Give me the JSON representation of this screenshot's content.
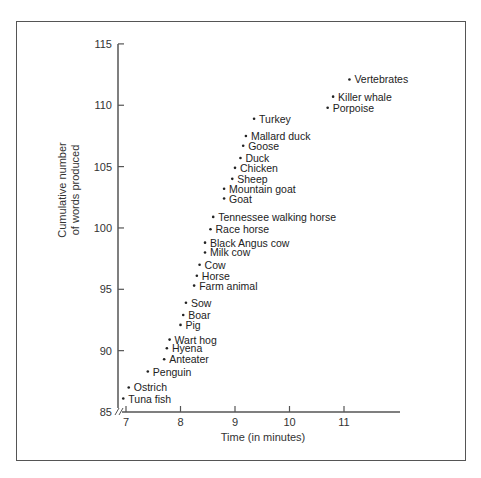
{
  "chart_data": {
    "type": "scatter",
    "title": "",
    "xlabel": "Time (in minutes)",
    "ylabel": "Cumulative number of words produced",
    "ylabel_lines": [
      "Cumulative number",
      "of words produced"
    ],
    "xlim": [
      7,
      12
    ],
    "ylim": [
      85,
      115
    ],
    "x_ticks": [
      7,
      8,
      9,
      10,
      11
    ],
    "y_ticks": [
      85,
      90,
      95,
      100,
      105,
      110,
      115
    ],
    "grid": false,
    "legend": "none",
    "axis_break": "y-axis broken near origin (85)",
    "points": [
      {
        "label": "Vertebrates",
        "x": 11.1,
        "y": 112.1
      },
      {
        "label": "Killer whale",
        "x": 10.8,
        "y": 110.7
      },
      {
        "label": "Porpoise",
        "x": 10.7,
        "y": 109.8
      },
      {
        "label": "Turkey",
        "x": 9.35,
        "y": 108.9
      },
      {
        "label": "Mallard duck",
        "x": 9.2,
        "y": 107.5
      },
      {
        "label": "Goose",
        "x": 9.15,
        "y": 106.7
      },
      {
        "label": "Duck",
        "x": 9.1,
        "y": 105.7
      },
      {
        "label": "Chicken",
        "x": 9.0,
        "y": 104.9
      },
      {
        "label": "Sheep",
        "x": 8.95,
        "y": 104.0
      },
      {
        "label": "Mountain goat",
        "x": 8.8,
        "y": 103.2
      },
      {
        "label": "Goat",
        "x": 8.8,
        "y": 102.4
      },
      {
        "label": "Tennessee walking horse",
        "x": 8.6,
        "y": 100.9
      },
      {
        "label": "Race horse",
        "x": 8.55,
        "y": 99.9
      },
      {
        "label": "Black Angus cow",
        "x": 8.45,
        "y": 98.8
      },
      {
        "label": "Milk cow",
        "x": 8.45,
        "y": 98.0
      },
      {
        "label": "Cow",
        "x": 8.35,
        "y": 97.0
      },
      {
        "label": "Horse",
        "x": 8.3,
        "y": 96.1
      },
      {
        "label": "Farm animal",
        "x": 8.25,
        "y": 95.3
      },
      {
        "label": "Sow",
        "x": 8.1,
        "y": 93.9
      },
      {
        "label": "Boar",
        "x": 8.05,
        "y": 92.9
      },
      {
        "label": "Pig",
        "x": 8.0,
        "y": 92.1
      },
      {
        "label": "Wart hog",
        "x": 7.8,
        "y": 90.9
      },
      {
        "label": "Hyena",
        "x": 7.75,
        "y": 90.2
      },
      {
        "label": "Anteater",
        "x": 7.7,
        "y": 89.3
      },
      {
        "label": "Penguin",
        "x": 7.4,
        "y": 88.3
      },
      {
        "label": "Ostrich",
        "x": 7.05,
        "y": 87.0
      },
      {
        "label": "Tuna fish",
        "x": 6.95,
        "y": 86.1
      }
    ]
  },
  "colors": {
    "axis": "#555555",
    "text": "#222222",
    "frame": "#555555"
  }
}
